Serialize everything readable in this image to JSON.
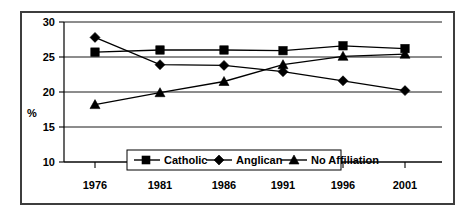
{
  "chart_data": {
    "type": "line",
    "title": "",
    "xlabel": "",
    "ylabel": "%",
    "categories": [
      "1976",
      "1981",
      "1986",
      "1991",
      "1996",
      "2001"
    ],
    "ylim": [
      10,
      30
    ],
    "yticks": [
      "10",
      "15",
      "20",
      "25",
      "30"
    ],
    "grid": true,
    "legend_position": "inside-bottom-center",
    "series": [
      {
        "name": "Catholic",
        "marker": "square",
        "values": [
          25.7,
          26.0,
          26.0,
          25.9,
          26.6,
          26.2
        ]
      },
      {
        "name": "Anglican",
        "marker": "diamond",
        "values": [
          27.8,
          23.9,
          23.8,
          22.9,
          21.6,
          20.2
        ]
      },
      {
        "name": "No Affiliation",
        "marker": "triangle",
        "values": [
          18.2,
          19.9,
          21.5,
          23.9,
          25.1,
          25.4
        ]
      }
    ]
  },
  "axis": {
    "y_title": "%",
    "y_tick_0": "10",
    "y_tick_1": "15",
    "y_tick_2": "20",
    "y_tick_3": "25",
    "y_tick_4": "30",
    "x_tick_0": "1976",
    "x_tick_1": "1981",
    "x_tick_2": "1986",
    "x_tick_3": "1991",
    "x_tick_4": "1996",
    "x_tick_5": "2001"
  },
  "legend": {
    "item_0": "Catholic",
    "item_1": "Anglican",
    "item_2": "No Affiliation"
  },
  "colors": {
    "ink": "#000000",
    "frame": "#3d3d3d",
    "background": "#ffffff"
  }
}
